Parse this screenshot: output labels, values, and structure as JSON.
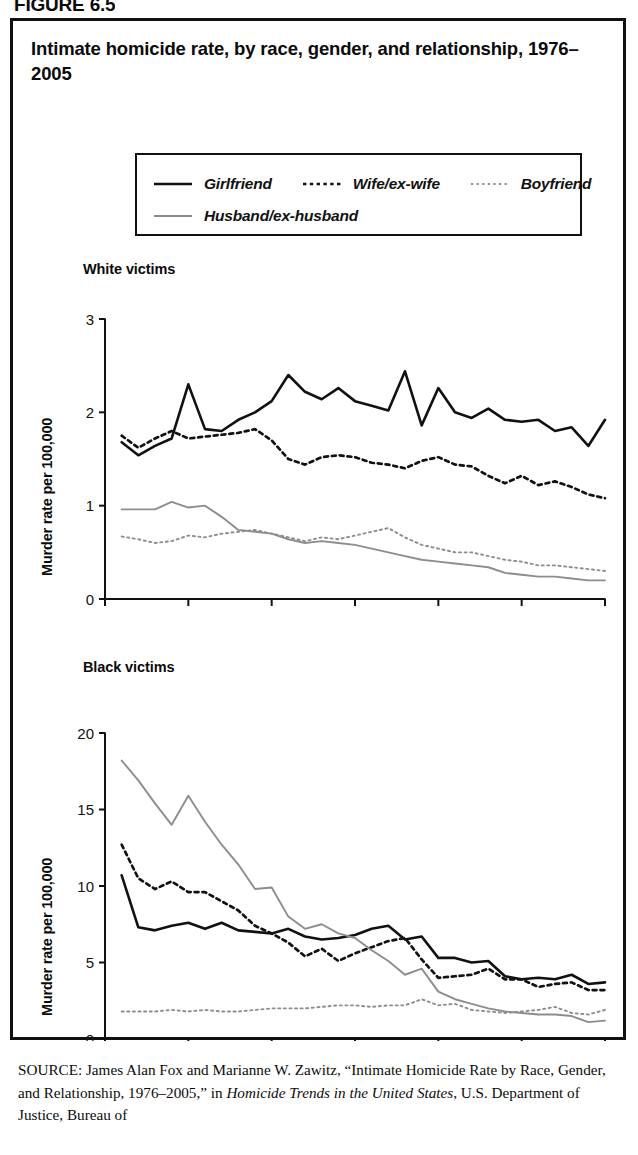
{
  "figure_label": "FIGURE 6.5",
  "title": "Intimate homicide rate, by race, gender, and relationship, 1976–2005",
  "legend": {
    "entries": [
      {
        "label": "Girlfriend",
        "style": "solid",
        "color": "#111111",
        "width": 2.6
      },
      {
        "label": "Wife/ex-wife",
        "style": "dashed",
        "color": "#111111",
        "width": 2.6
      },
      {
        "label": "Boyfriend",
        "style": "dotted",
        "color": "#8d8d8d",
        "width": 2.0
      },
      {
        "label": "Husband/ex-husband",
        "style": "solid",
        "color": "#8d8d8d",
        "width": 2.0
      }
    ]
  },
  "source": {
    "kicker": "SOURCE:",
    "text_1": " James Alan Fox and Marianne W. Zawitz, “Intimate Homicide Rate by Race, Gender, and Relationship, 1976–2005,” in ",
    "italic_1": "Homicide Trends in the United States",
    "text_2": ", U.S. Department of Justice, Bureau of"
  },
  "chart_data": [
    {
      "type": "line",
      "panel": "White victims",
      "title": "Intimate homicide rate, by race, gender, and relationship, 1976–2005",
      "xlabel": "",
      "ylabel": "Murder rate per 100,000",
      "xlim": [
        1975,
        2005
      ],
      "ylim": [
        0,
        3
      ],
      "yticks": [
        0,
        1,
        2,
        3
      ],
      "xticks": [
        1975,
        1980,
        1985,
        1990,
        1995,
        2000,
        2005
      ],
      "grid": false,
      "legend_position": "top",
      "x": [
        1976,
        1977,
        1978,
        1979,
        1980,
        1981,
        1982,
        1983,
        1984,
        1985,
        1986,
        1987,
        1988,
        1989,
        1990,
        1991,
        1992,
        1993,
        1994,
        1995,
        1996,
        1997,
        1998,
        1999,
        2000,
        2001,
        2002,
        2003,
        2004,
        2005
      ],
      "series": [
        {
          "name": "Girlfriend",
          "style": "solid",
          "color": "#111111",
          "values": [
            1.68,
            1.54,
            1.64,
            1.72,
            2.3,
            1.82,
            1.8,
            1.92,
            2.0,
            2.12,
            2.4,
            2.22,
            2.14,
            2.26,
            2.12,
            2.07,
            2.02,
            2.44,
            1.86,
            2.26,
            2.0,
            1.94,
            2.04,
            1.92,
            1.9,
            1.92,
            1.8,
            1.84,
            1.64,
            1.92
          ]
        },
        {
          "name": "Wife/ex-wife",
          "style": "dashed",
          "color": "#111111",
          "values": [
            1.75,
            1.62,
            1.72,
            1.8,
            1.72,
            1.74,
            1.76,
            1.78,
            1.82,
            1.7,
            1.5,
            1.44,
            1.52,
            1.54,
            1.52,
            1.46,
            1.44,
            1.4,
            1.48,
            1.52,
            1.44,
            1.42,
            1.32,
            1.24,
            1.32,
            1.22,
            1.26,
            1.2,
            1.12,
            1.08
          ]
        },
        {
          "name": "Boyfriend",
          "style": "dotted",
          "color": "#8d8d8d",
          "values": [
            0.67,
            0.64,
            0.6,
            0.62,
            0.68,
            0.66,
            0.7,
            0.72,
            0.74,
            0.7,
            0.66,
            0.62,
            0.66,
            0.64,
            0.68,
            0.72,
            0.76,
            0.66,
            0.58,
            0.54,
            0.5,
            0.5,
            0.46,
            0.42,
            0.4,
            0.36,
            0.36,
            0.34,
            0.32,
            0.3
          ]
        },
        {
          "name": "Husband/ex-husband",
          "style": "solid",
          "color": "#8d8d8d",
          "values": [
            0.96,
            0.96,
            0.96,
            1.04,
            0.98,
            1.0,
            0.88,
            0.74,
            0.72,
            0.7,
            0.64,
            0.6,
            0.62,
            0.6,
            0.58,
            0.54,
            0.5,
            0.46,
            0.42,
            0.4,
            0.38,
            0.36,
            0.34,
            0.28,
            0.26,
            0.24,
            0.24,
            0.22,
            0.2,
            0.2
          ]
        }
      ]
    },
    {
      "type": "line",
      "panel": "Black victims",
      "title": "Intimate homicide rate, by race, gender, and relationship, 1976–2005",
      "xlabel": "",
      "ylabel": "Murder rate per 100,000",
      "xlim": [
        1975,
        2005
      ],
      "ylim": [
        0,
        20
      ],
      "yticks": [
        0,
        5,
        10,
        15,
        20
      ],
      "xticks": [
        1975,
        1980,
        1985,
        1990,
        1995,
        2000,
        2005
      ],
      "grid": false,
      "legend_position": "top",
      "x": [
        1976,
        1977,
        1978,
        1979,
        1980,
        1981,
        1982,
        1983,
        1984,
        1985,
        1986,
        1987,
        1988,
        1989,
        1990,
        1991,
        1992,
        1993,
        1994,
        1995,
        1996,
        1997,
        1998,
        1999,
        2000,
        2001,
        2002,
        2003,
        2004,
        2005
      ],
      "series": [
        {
          "name": "Girlfriend",
          "style": "solid",
          "color": "#111111",
          "values": [
            10.7,
            7.3,
            7.1,
            7.4,
            7.6,
            7.2,
            7.6,
            7.1,
            7.0,
            6.9,
            7.2,
            6.7,
            6.5,
            6.6,
            6.8,
            7.2,
            7.4,
            6.5,
            6.7,
            5.3,
            5.3,
            5.0,
            5.1,
            4.1,
            3.9,
            4.0,
            3.9,
            4.2,
            3.6,
            3.7
          ]
        },
        {
          "name": "Wife/ex-wife",
          "style": "dashed",
          "color": "#111111",
          "values": [
            12.7,
            10.5,
            9.8,
            10.3,
            9.6,
            9.6,
            9.0,
            8.4,
            7.4,
            6.9,
            6.3,
            5.4,
            5.9,
            5.1,
            5.6,
            6.0,
            6.4,
            6.6,
            5.2,
            4.0,
            4.1,
            4.2,
            4.6,
            3.9,
            3.9,
            3.4,
            3.6,
            3.7,
            3.2,
            3.2
          ]
        },
        {
          "name": "Boyfriend",
          "style": "dotted",
          "color": "#8d8d8d",
          "values": [
            1.8,
            1.8,
            1.8,
            1.9,
            1.8,
            1.9,
            1.8,
            1.8,
            1.9,
            2.0,
            2.0,
            2.0,
            2.1,
            2.2,
            2.2,
            2.1,
            2.2,
            2.2,
            2.6,
            2.2,
            2.3,
            1.9,
            1.8,
            1.7,
            1.8,
            1.9,
            2.1,
            1.7,
            1.6,
            1.9
          ]
        },
        {
          "name": "Husband/ex-husband",
          "style": "solid",
          "color": "#8d8d8d",
          "values": [
            18.2,
            16.9,
            15.4,
            14.0,
            15.9,
            14.2,
            12.7,
            11.4,
            9.8,
            9.9,
            8.0,
            7.2,
            7.5,
            6.9,
            6.6,
            5.8,
            5.1,
            4.2,
            4.6,
            3.1,
            2.6,
            2.3,
            2.0,
            1.8,
            1.7,
            1.6,
            1.6,
            1.5,
            1.1,
            1.2
          ]
        }
      ]
    }
  ]
}
